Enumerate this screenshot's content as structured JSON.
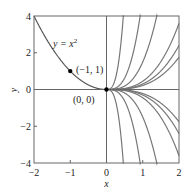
{
  "chart_data": {
    "type": "line",
    "title": "",
    "xlabel": "x",
    "ylabel": "y",
    "xlim": [
      -2,
      2
    ],
    "ylim": [
      -4,
      4
    ],
    "x_ticks": [
      "-2",
      "-1",
      "0",
      "1",
      "2"
    ],
    "y_ticks": [
      "-4",
      "-2",
      "0",
      "2",
      "4"
    ],
    "grid": false,
    "legend": null,
    "series": [
      {
        "name": "y = x^2",
        "domain": [
          -2,
          0
        ],
        "formula": "x^2",
        "color": "#555555"
      },
      {
        "name": "y = 40x^3",
        "domain": [
          0,
          2
        ],
        "formula": "40*x^3",
        "color": "#777777"
      },
      {
        "name": "y = 5x^3",
        "domain": [
          0,
          2
        ],
        "formula": "5*x^3",
        "color": "#777777"
      },
      {
        "name": "y = 1.5x^3",
        "domain": [
          0,
          2
        ],
        "formula": "1.5*x^3",
        "color": "#777777"
      },
      {
        "name": "y = 0.45x^3",
        "domain": [
          0,
          2
        ],
        "formula": "0.45*x^3",
        "color": "#777777"
      },
      {
        "name": "y = 0.3x^3",
        "domain": [
          0,
          2
        ],
        "formula": "0.3*x^3",
        "color": "#777777"
      },
      {
        "name": "y = 0.22x^3",
        "domain": [
          0,
          2
        ],
        "formula": "0.22*x^3",
        "color": "#777777"
      },
      {
        "name": "y = 0",
        "domain": [
          0,
          2
        ],
        "formula": "0",
        "color": "#777777"
      },
      {
        "name": "y = -0.22x^3",
        "domain": [
          0,
          2
        ],
        "formula": "-0.22*x^3",
        "color": "#777777"
      },
      {
        "name": "y = -0.3x^3",
        "domain": [
          0,
          2
        ],
        "formula": "-0.3*x^3",
        "color": "#777777"
      },
      {
        "name": "y = -0.45x^3",
        "domain": [
          0,
          2
        ],
        "formula": "-0.45*x^3",
        "color": "#777777"
      },
      {
        "name": "y = -1.5x^3",
        "domain": [
          0,
          2
        ],
        "formula": "-1.5*x^3",
        "color": "#777777"
      },
      {
        "name": "y = -5x^3",
        "domain": [
          0,
          2
        ],
        "formula": "-5*x^3",
        "color": "#777777"
      },
      {
        "name": "y = -40x^3",
        "domain": [
          0,
          2
        ],
        "formula": "-40*x^3",
        "color": "#777777"
      }
    ],
    "points": [
      {
        "label": "(-1, 1)",
        "x": -1,
        "y": 1
      },
      {
        "label": "(0, 0)",
        "x": 0,
        "y": 0
      }
    ],
    "annotations": [
      {
        "text": "y = x",
        "sup": "2",
        "x": -1.55,
        "y": 2.45
      }
    ]
  },
  "labels": {
    "curve_label_main": "y = x",
    "curve_label_sup": "2",
    "point_a": "(−1, 1)",
    "point_b": "(0, 0)",
    "xlabel": "x",
    "ylabel": "y",
    "xticks": [
      "−2",
      "−1",
      "0",
      "1",
      "2"
    ],
    "yticks": [
      "4",
      "2",
      "0",
      "−2",
      "−4"
    ]
  }
}
